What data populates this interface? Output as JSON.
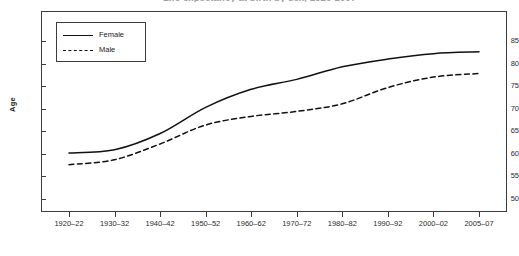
{
  "chart_data": {
    "type": "line",
    "title": "Life expectancy at birth by sex, 1920-2007",
    "xlabel": "",
    "ylabel": "Age",
    "categories": [
      "1920–22",
      "1930–32",
      "1940–42",
      "1950–52",
      "1960–62",
      "1970–72",
      "1980–82",
      "1990–92",
      "2000–02",
      "2005–07"
    ],
    "series": [
      {
        "name": "Female",
        "style": "solid",
        "values": [
          60.2,
          60.9,
          64.5,
          70.3,
          74.3,
          76.5,
          79.3,
          81.0,
          82.2,
          82.6
        ]
      },
      {
        "name": "Male",
        "style": "dashed",
        "values": [
          57.6,
          58.7,
          62.2,
          66.4,
          68.3,
          69.4,
          71.1,
          74.7,
          77.0,
          77.8
        ]
      }
    ],
    "ylim": [
      48,
      87
    ],
    "yticks": [
      50,
      55,
      60,
      65,
      70,
      75,
      80,
      85
    ],
    "grid": false,
    "legend_position": "top-left-inside"
  },
  "axes": {
    "y_title": "Age",
    "y_tick_labels": [
      "85",
      "80",
      "75",
      "70",
      "65",
      "60",
      "55",
      "50"
    ],
    "x_tick_labels": [
      "1920–22",
      "1930–32",
      "1940–42",
      "1950–52",
      "1960–62",
      "1970–72",
      "1980–82",
      "1990–92",
      "2000–02",
      "2005–07"
    ]
  },
  "legend": {
    "entries": [
      {
        "label": "Female"
      },
      {
        "label": "Male"
      }
    ]
  },
  "colors": {
    "line": "#111111",
    "frame": "#3c3c3c",
    "text": "#1a1a1a",
    "background": "#ffffff"
  }
}
